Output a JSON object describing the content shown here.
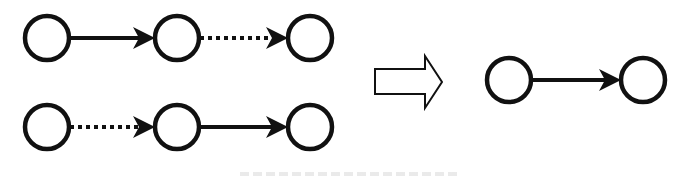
{
  "figure": {
    "colors": {
      "stroke": "#111111",
      "node_fill": "#ffffff",
      "background": "#ffffff"
    },
    "left_panel": {
      "rows": [
        {
          "id": "top-chain",
          "nodes": [
            {
              "cx": 47,
              "cy": 38
            },
            {
              "cx": 177,
              "cy": 38
            },
            {
              "cx": 310,
              "cy": 38
            }
          ],
          "edges": [
            {
              "from": 0,
              "to": 1,
              "style": "solid"
            },
            {
              "from": 1,
              "to": 2,
              "style": "dotted"
            }
          ]
        },
        {
          "id": "bottom-chain",
          "nodes": [
            {
              "cx": 47,
              "cy": 127
            },
            {
              "cx": 177,
              "cy": 127
            },
            {
              "cx": 310,
              "cy": 127
            }
          ],
          "edges": [
            {
              "from": 0,
              "to": 1,
              "style": "dotted"
            },
            {
              "from": 1,
              "to": 2,
              "style": "solid"
            }
          ]
        }
      ]
    },
    "transform_arrow": {
      "icon": "hollow-right-arrow-icon",
      "direction": "right"
    },
    "right_panel": {
      "nodes": [
        {
          "cx": 509,
          "cy": 80
        },
        {
          "cx": 643,
          "cy": 80
        }
      ],
      "edges": [
        {
          "from": 0,
          "to": 1,
          "style": "solid"
        }
      ]
    },
    "node_radius": 22,
    "caption": {
      "visible": "clipped",
      "text": ""
    }
  }
}
